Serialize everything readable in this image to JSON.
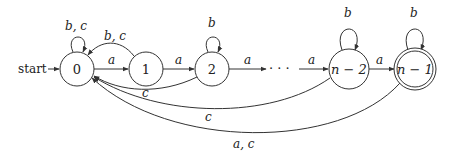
{
  "diagram": {
    "type": "finite-automaton",
    "start_label": "start",
    "ellipsis": "· · ·",
    "states": [
      {
        "id": "0",
        "label": "0",
        "accepting": false,
        "start": true
      },
      {
        "id": "1",
        "label": "1",
        "accepting": false,
        "start": false
      },
      {
        "id": "2",
        "label": "2",
        "accepting": false,
        "start": false
      },
      {
        "id": "n-2",
        "label": "n − 2",
        "accepting": false,
        "start": false
      },
      {
        "id": "n-1",
        "label": "n − 1",
        "accepting": true,
        "start": false
      }
    ],
    "transitions": [
      {
        "from": "0",
        "to": "0",
        "label": "b, c"
      },
      {
        "from": "0",
        "to": "1",
        "label": "a"
      },
      {
        "from": "1",
        "to": "0",
        "label": "b, c"
      },
      {
        "from": "1",
        "to": "2",
        "label": "a"
      },
      {
        "from": "2",
        "to": "2",
        "label": "b"
      },
      {
        "from": "2",
        "to": "…",
        "label": "a"
      },
      {
        "from": "2",
        "to": "0",
        "label": "c"
      },
      {
        "from": "…",
        "to": "n-2",
        "label": "a"
      },
      {
        "from": "n-2",
        "to": "n-2",
        "label": "b"
      },
      {
        "from": "n-2",
        "to": "n-1",
        "label": "a"
      },
      {
        "from": "n-2",
        "to": "0",
        "label": "c"
      },
      {
        "from": "n-1",
        "to": "n-1",
        "label": "b"
      },
      {
        "from": "n-1",
        "to": "0",
        "label": "a, c"
      }
    ]
  }
}
